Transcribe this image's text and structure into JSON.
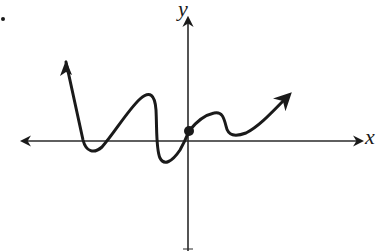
{
  "figure": {
    "type": "function-graph-sketch",
    "x_axis_label": "x",
    "y_axis_label": "y",
    "colors": {
      "ink": "#1a1a1a",
      "axis": "#2a2a2a",
      "background": "#ffffff"
    },
    "axes": {
      "x_axis": {
        "arrows": "both",
        "ticks": false
      },
      "y_axis": {
        "arrows": "top",
        "ticks": false
      }
    },
    "curve": {
      "description": "Continuous curve with arrows at both ends; rises steeply to the upper-left, dips below x-axis, rises to a local max, drops below x-axis, passes through a marked point near the origin (on the y-axis, slightly above x-axis), small local max, small local min above x-axis, then rises to the upper-right.",
      "marked_point": "y-intercept (filled dot)",
      "end_behavior": {
        "left": "up",
        "right": "up"
      },
      "x_intercepts_count": 4,
      "turning_points": [
        {
          "kind": "min",
          "position": "left of y-axis, just below x-axis"
        },
        {
          "kind": "max",
          "position": "left of y-axis, above x-axis"
        },
        {
          "kind": "min",
          "position": "left of y-axis, below x-axis"
        },
        {
          "kind": "max",
          "position": "right of y-axis, above x-axis"
        },
        {
          "kind": "min",
          "position": "right of y-axis, slightly above x-axis"
        }
      ]
    }
  }
}
